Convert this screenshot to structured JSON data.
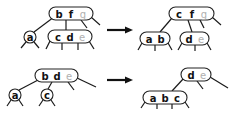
{
  "diagram": {
    "type": "b-tree-rotation-and-merge",
    "panels": [
      {
        "name": "top-before",
        "root": {
          "keys": [
            "b",
            "f",
            "g"
          ],
          "faded": [
            false,
            false,
            true
          ]
        },
        "children": [
          {
            "keys": [
              "a"
            ],
            "faded": [
              false
            ]
          },
          {
            "keys": [
              "c",
              "d",
              "e"
            ],
            "faded": [
              false,
              false,
              true
            ]
          }
        ]
      },
      {
        "name": "top-after",
        "root": {
          "keys": [
            "c",
            "f",
            "g"
          ],
          "faded": [
            false,
            false,
            true
          ]
        },
        "children": [
          {
            "keys": [
              "a",
              "b"
            ],
            "faded": [
              false,
              false
            ]
          },
          {
            "keys": [
              "d",
              "e"
            ],
            "faded": [
              false,
              true
            ]
          }
        ]
      },
      {
        "name": "bottom-before",
        "root": {
          "keys": [
            "b",
            "d",
            "e"
          ],
          "faded": [
            false,
            false,
            true
          ]
        },
        "children": [
          {
            "keys": [
              "a"
            ],
            "faded": [
              false
            ]
          },
          {
            "keys": [
              "c"
            ],
            "faded": [
              false
            ]
          }
        ]
      },
      {
        "name": "bottom-after",
        "root": {
          "keys": [
            "d",
            "e"
          ],
          "faded": [
            false,
            true
          ]
        },
        "children": [
          {
            "keys": [
              "a",
              "b",
              "c"
            ],
            "faded": [
              false,
              false,
              false
            ]
          }
        ]
      }
    ],
    "arrows": [
      {
        "from": "top-before",
        "to": "top-after",
        "direction": "right"
      },
      {
        "from": "bottom-before",
        "to": "bottom-after",
        "direction": "right"
      }
    ],
    "colors": {
      "key": "#111111",
      "faded_key": "#b0b0b0",
      "outline": "#222222",
      "background": "#ffffff"
    }
  },
  "labels": {
    "tl_root_k0": "b",
    "tl_root_k1": "f",
    "tl_root_k2": "g",
    "tl_a": "a",
    "tl_mid_k0": "c",
    "tl_mid_k1": "d",
    "tl_mid_k2": "e",
    "tr_root_k0": "c",
    "tr_root_k1": "f",
    "tr_root_k2": "g",
    "tr_left_k0": "a",
    "tr_left_k1": "b",
    "tr_right_k0": "d",
    "tr_right_k1": "e",
    "bl_root_k0": "b",
    "bl_root_k1": "d",
    "bl_root_k2": "e",
    "bl_a": "a",
    "bl_c": "c",
    "br_root_k0": "d",
    "br_root_k1": "e",
    "br_child_k0": "a",
    "br_child_k1": "b",
    "br_child_k2": "c"
  }
}
